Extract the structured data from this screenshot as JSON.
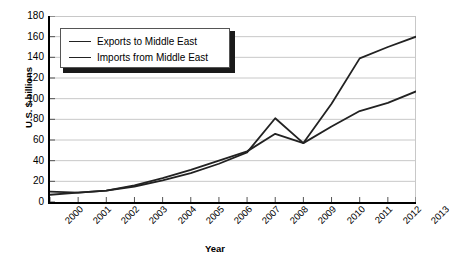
{
  "chart_data": {
    "type": "line",
    "title": "",
    "xlabel": "Year",
    "ylabel": "U.S. $ billions",
    "categories": [
      "2000",
      "2001",
      "2002",
      "2003",
      "2004",
      "2005",
      "2006",
      "2007",
      "2008",
      "2009",
      "2010",
      "2011",
      "2012",
      "2013"
    ],
    "x": [
      2000,
      2001,
      2002,
      2003,
      2004,
      2005,
      2006,
      2007,
      2008,
      2009,
      2010,
      2011,
      2012,
      2013
    ],
    "series": [
      {
        "name": "Exports to Middle East",
        "values": [
          10,
          9,
          11,
          15,
          21,
          28,
          37,
          48,
          81,
          57,
          95,
          139,
          150,
          160
        ],
        "color": "#222222"
      },
      {
        "name": "Imports from Middle East",
        "values": [
          7,
          9,
          11,
          16,
          23,
          31,
          40,
          49,
          66,
          57,
          73,
          88,
          96,
          107
        ],
        "color": "#222222"
      }
    ],
    "ylim": [
      0,
      180
    ],
    "yticks": [
      0,
      20,
      40,
      60,
      80,
      100,
      120,
      140,
      160,
      180
    ],
    "ytick_labels": [
      "0",
      "20",
      "40",
      "60",
      "80",
      "100",
      "120",
      "140",
      "160",
      "180"
    ],
    "grid": true,
    "grid_axis": "y",
    "grid_color": "#c8c8c8",
    "legend_position": "upper-left",
    "axis_color": "#000000",
    "background": "#ffffff"
  }
}
